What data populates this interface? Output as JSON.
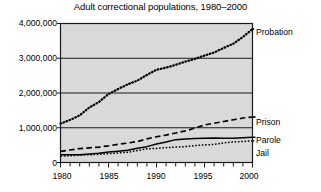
{
  "chart_data": {
    "type": "line",
    "title": "Adult correctional populations, 1980–2000",
    "xlabel": "",
    "ylabel": "",
    "xlim": [
      1980,
      2000
    ],
    "ylim": [
      0,
      4000000
    ],
    "grid": true,
    "gridlines_y": [
      0,
      1000000,
      2000000,
      3000000,
      4000000
    ],
    "legend_position": "right-inline",
    "x": [
      1980,
      1981,
      1982,
      1983,
      1984,
      1985,
      1986,
      1987,
      1988,
      1989,
      1990,
      1991,
      1992,
      1993,
      1994,
      1995,
      1996,
      1997,
      1998,
      1999,
      2000
    ],
    "y_tick_labels": [
      "0",
      "1,000,000",
      "2,000,000",
      "3,000,000",
      "4,000,000"
    ],
    "y_tick_values": [
      0,
      1000000,
      2000000,
      3000000,
      4000000
    ],
    "x_tick_labels": [
      "1980",
      "1985",
      "1990",
      "1995",
      "2000"
    ],
    "x_tick_values": [
      1980,
      1985,
      1990,
      1995,
      2000
    ],
    "x_minor_ticks": [
      1981,
      1982,
      1983,
      1984,
      1986,
      1987,
      1988,
      1989,
      1991,
      1992,
      1993,
      1994,
      1996,
      1997,
      1998,
      1999
    ],
    "series": [
      {
        "name": "Probation",
        "style": "dotted-thick",
        "label": "Probation",
        "values": [
          1118000,
          1225000,
          1357000,
          1582000,
          1740000,
          1969000,
          2115000,
          2248000,
          2356000,
          2522000,
          2670000,
          2729000,
          2811000,
          2903000,
          2981000,
          3078000,
          3165000,
          3297000,
          3417000,
          3614000,
          3840000
        ]
      },
      {
        "name": "Prison",
        "style": "dashed",
        "label": "Prison",
        "values": [
          320000,
          360000,
          400000,
          420000,
          445000,
          480000,
          523000,
          560000,
          603000,
          680000,
          740000,
          790000,
          850000,
          910000,
          990000,
          1080000,
          1130000,
          1180000,
          1230000,
          1280000,
          1310000
        ]
      },
      {
        "name": "Parole",
        "style": "solid",
        "label": "Parole",
        "values": [
          220000,
          225000,
          225000,
          245000,
          265000,
          300000,
          325000,
          355000,
          407000,
          456000,
          531000,
          590000,
          658000,
          676000,
          690000,
          700000,
          705000,
          695000,
          700000,
          715000,
          725000
        ]
      },
      {
        "name": "Jail",
        "style": "dotted-fine",
        "label": "Jail",
        "values": [
          182000,
          196000,
          209000,
          224000,
          234000,
          256000,
          274000,
          295000,
          343000,
          395000,
          405000,
          426000,
          445000,
          459000,
          486000,
          507000,
          518000,
          567000,
          592000,
          605000,
          621000
        ]
      }
    ]
  },
  "axis": {
    "y_labels": [
      {
        "text": "4,000,000",
        "value": 4000000
      },
      {
        "text": "3,000,000",
        "value": 3000000
      },
      {
        "text": "2,000,000",
        "value": 2000000
      },
      {
        "text": "1,000,000",
        "value": 1000000
      },
      {
        "text": "0",
        "value": 0
      }
    ],
    "x_labels": [
      {
        "text": "1980",
        "value": 1980
      },
      {
        "text": "1985",
        "value": 1985
      },
      {
        "text": "1990",
        "value": 1990
      },
      {
        "text": "1995",
        "value": 1995
      },
      {
        "text": "2000",
        "value": 2000
      }
    ]
  },
  "colors": {
    "plot_background": "#d9d9d9",
    "frame": "#1a1a1a",
    "gridline": "#1a1a1a",
    "series_line": "#000000",
    "page_background": "#ffffff",
    "text": "#000000"
  }
}
